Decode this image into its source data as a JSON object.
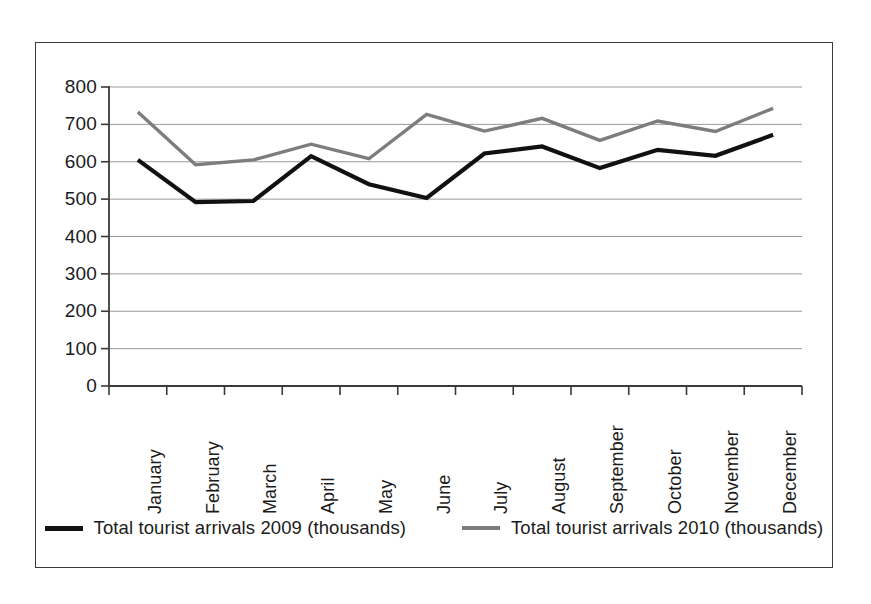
{
  "chart_data": {
    "type": "line",
    "title": "",
    "xlabel": "",
    "ylabel": "",
    "categories": [
      "January",
      "February",
      "March",
      "April",
      "May",
      "June",
      "July",
      "August",
      "September",
      "October",
      "November",
      "December"
    ],
    "series": [
      {
        "name": "Total tourist arrivals 2009 (thousands)",
        "color": "#111111",
        "values": [
          605,
          492,
          495,
          615,
          540,
          503,
          622,
          641,
          583,
          632,
          616,
          672
        ]
      },
      {
        "name": "Total tourist arrivals 2010 (thousands)",
        "color": "#7d7d7d",
        "values": [
          733,
          592,
          605,
          647,
          608,
          727,
          682,
          716,
          657,
          709,
          681,
          743
        ]
      }
    ],
    "ylim": [
      0,
      800
    ],
    "yticks": [
      0,
      100,
      200,
      300,
      400,
      500,
      600,
      700,
      800
    ],
    "ytick_labels": [
      "0",
      "100",
      "200",
      "300",
      "400",
      "500",
      "600",
      "700",
      "800"
    ],
    "grid": true,
    "grid_axis": "y",
    "grid_color": "#9a9a9a",
    "legend_position": "bottom",
    "axis_color": "#3a3a3a",
    "border_color": "#3a3a3a",
    "background": "#ffffff"
  },
  "legend": {
    "items": [
      {
        "label": "Total tourist arrivals 2009 (thousands)",
        "color": "#111111"
      },
      {
        "label": "Total tourist arrivals 2010 (thousands)",
        "color": "#7d7d7d"
      }
    ]
  }
}
